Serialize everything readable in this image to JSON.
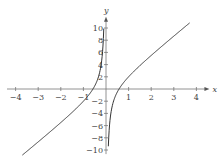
{
  "chart_data": {
    "type": "line",
    "title": "",
    "xlabel": "x",
    "ylabel": "y",
    "function": "y = 3x - 1/x",
    "xlim": [
      -4.3,
      4.4
    ],
    "ylim": [
      -11,
      11.5
    ],
    "x_ticks": [
      -4,
      -3,
      -2,
      -1,
      1,
      2,
      3,
      4
    ],
    "x_tick_labels": [
      "−4",
      "−3",
      "−2",
      "−1",
      "1",
      "2",
      "3",
      "4"
    ],
    "y_ticks": [
      10,
      8,
      6,
      4,
      2,
      -2,
      -4,
      -6,
      -8,
      -10
    ],
    "y_tick_labels": [
      "10",
      "8",
      "6",
      "4",
      "2",
      "−2",
      "−4",
      "−6",
      "−8",
      "−10"
    ],
    "grid": false,
    "legend": null,
    "series": [
      {
        "name": "left branch",
        "x": [
          -3.7,
          -3,
          -2,
          -1,
          -0.577,
          -0.4,
          -0.3,
          -0.2,
          -0.15,
          -0.1
        ],
        "y": [
          -10.83,
          -8.67,
          -5.5,
          -2,
          0,
          1.3,
          2.43,
          4.4,
          6.22,
          9.7
        ]
      },
      {
        "name": "right branch",
        "x": [
          0.1,
          0.15,
          0.2,
          0.3,
          0.4,
          0.577,
          1,
          2,
          3,
          3.7
        ],
        "y": [
          -9.7,
          -6.22,
          -4.4,
          -2.43,
          -1.3,
          0,
          2,
          5.5,
          8.67,
          10.83
        ]
      }
    ],
    "color": "#333333"
  }
}
